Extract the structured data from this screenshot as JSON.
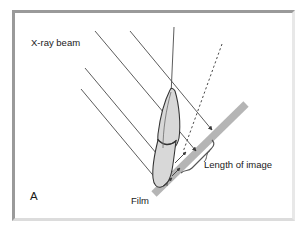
{
  "figure": {
    "panel_letter": "A",
    "labels": {
      "xray_beam": "X-ray beam",
      "film": "Film",
      "length_of_image": "Length of image"
    },
    "colors": {
      "frame_border": "#9a9a9a",
      "background": "#ffffff",
      "film_bar": "#b5b5b5",
      "beam_line": "#4a4a4a",
      "tooth_fill": "#d8d8d8",
      "tooth_outline": "#333333",
      "text": "#1a1a1a"
    },
    "elements": {
      "beam_count": 4,
      "beam_label": "parallel x-ray beam rays",
      "tooth_label": "tooth with root and crown",
      "film_label": "film bar",
      "dashed_label": "projection line",
      "bracket_label": "image length bracket",
      "axis_label": "tooth long axis"
    }
  }
}
